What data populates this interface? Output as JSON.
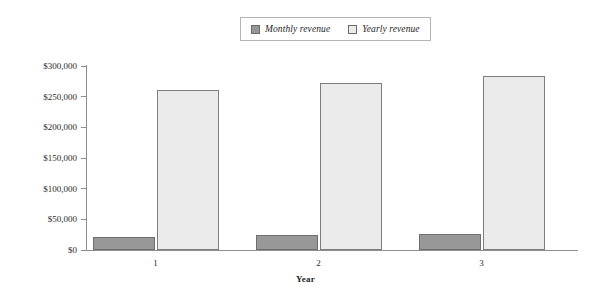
{
  "chart_data": {
    "type": "bar",
    "title": "",
    "xlabel": "Year",
    "ylabel": "",
    "categories": [
      "1",
      "2",
      "3"
    ],
    "series": [
      {
        "name": "Monthly revenue",
        "color": "#989898",
        "values": [
          22000,
          24000,
          26000
        ]
      },
      {
        "name": "Yearly revenue",
        "color": "#ebebeb",
        "values": [
          261000,
          272000,
          284000
        ]
      }
    ],
    "ylim": [
      0,
      300000
    ],
    "y_ticks": [
      0,
      50000,
      100000,
      150000,
      200000,
      250000,
      300000
    ],
    "y_tick_labels": [
      "$0",
      "$50,000",
      "$100,000",
      "$150,000",
      "$200,000",
      "$250,000",
      "$300,000"
    ],
    "grid": false,
    "legend_position": "top-center"
  },
  "legend": {
    "entries": [
      {
        "label": "Monthly revenue",
        "swatch": "monthly-swatch"
      },
      {
        "label": "Yearly revenue",
        "swatch": "yearly-swatch"
      }
    ]
  },
  "axes": {
    "x_title": "Year"
  },
  "colors": {
    "monthly_fill": "#989898",
    "monthly_stroke": "#6f6f6f",
    "yearly_fill": "#ebebeb",
    "yearly_stroke": "#7d7d7d",
    "axis": "#8e8e8e",
    "legend_border": "#b4b4b4",
    "text": "#2b2b2b"
  }
}
